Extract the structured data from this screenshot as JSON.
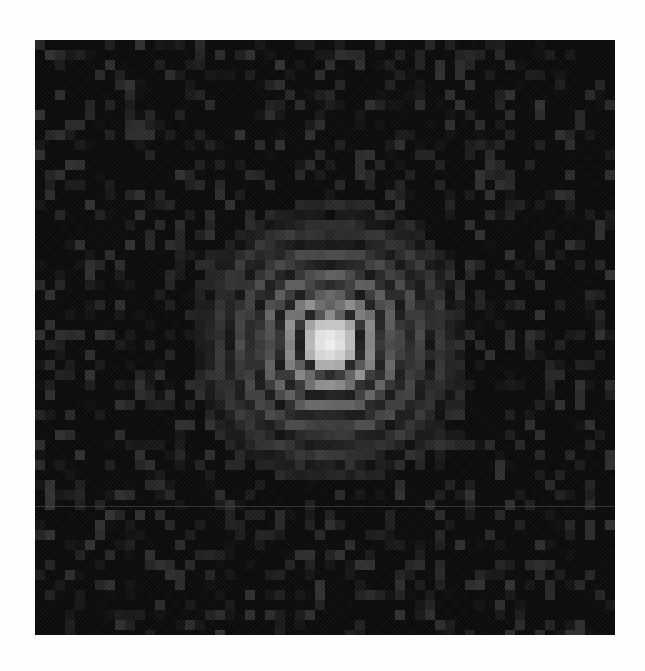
{
  "image": {
    "subject": "diffraction-pattern",
    "frame": {
      "left": 35,
      "top": 40,
      "width": 580,
      "height": 595
    },
    "background_color": "#0b0b0b",
    "page_color": "#fdfdfd",
    "block_size": 10,
    "center": {
      "x": 295,
      "y": 302
    },
    "core": {
      "radius": 26,
      "peak_gray": 236,
      "edge_gray": 160
    },
    "rings": [
      {
        "radius": 30,
        "gray": 30
      },
      {
        "radius": 42,
        "gray": 140
      },
      {
        "radius": 54,
        "gray": 28
      },
      {
        "radius": 64,
        "gray": 100
      },
      {
        "radius": 76,
        "gray": 26
      },
      {
        "radius": 88,
        "gray": 72
      },
      {
        "radius": 100,
        "gray": 22
      },
      {
        "radius": 112,
        "gray": 52
      },
      {
        "radius": 126,
        "gray": 20
      },
      {
        "radius": 140,
        "gray": 40
      }
    ],
    "background_speckle": {
      "min_gray": 10,
      "max_gray": 48,
      "density": 0.32
    },
    "scan_line_y": 466
  }
}
